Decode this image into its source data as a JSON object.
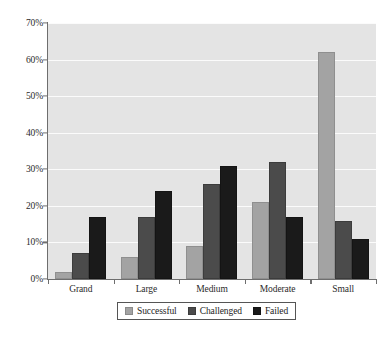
{
  "chart_data": {
    "type": "bar",
    "title": "",
    "subtitle": "",
    "xlabel": "",
    "ylabel": "",
    "categories": [
      "Grand",
      "Large",
      "Medium",
      "Moderate",
      "Small"
    ],
    "series": [
      {
        "name": "Successful",
        "color": "#a3a3a3",
        "values": [
          2,
          6,
          9,
          21,
          62
        ]
      },
      {
        "name": "Challenged",
        "color": "#4b4b4b",
        "values": [
          7,
          17,
          26,
          32,
          16
        ]
      },
      {
        "name": "Failed",
        "color": "#1a1a1a",
        "values": [
          17,
          24,
          31,
          17,
          11
        ]
      }
    ],
    "ylim": [
      0,
      70
    ],
    "ytick_values": [
      0,
      10,
      20,
      30,
      40,
      50,
      60,
      70
    ],
    "ytick_labels": [
      "0%",
      "10%",
      "20%",
      "30%",
      "40%",
      "50%",
      "60%",
      "70%"
    ],
    "grid": true,
    "grid_axis": "y",
    "legend_position": "bottom",
    "plot_background": "#e4e4e4",
    "gridline_color": "#fbfbfb",
    "axis_color": "#6e6e6e",
    "value_suffix": "%"
  },
  "legend": {
    "items": [
      {
        "label": "Successful"
      },
      {
        "label": "Challenged"
      },
      {
        "label": "Failed"
      }
    ]
  }
}
